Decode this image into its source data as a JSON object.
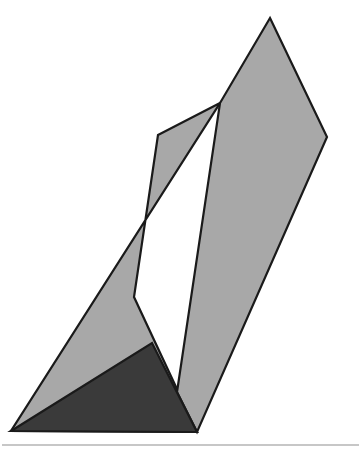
{
  "canvas": {
    "width": 361,
    "height": 470,
    "background_color": "#ffffff",
    "title": "Shaded geometric solid illustration"
  },
  "palette": {
    "light_gray_fill": "#a8a8a8",
    "dark_gray_fill": "#3a3a3a",
    "outline_stroke": "#1a1a1a",
    "rule_stroke": "#b4b4b4",
    "background": "#ffffff"
  },
  "figure": {
    "name": "two-faced-prism-with-shadow",
    "shapes": [
      {
        "id": "right-face",
        "label": "Right face",
        "fill_key": "light_gray_fill",
        "points": "270,18 327,137 197,432 177,392 220,103"
      },
      {
        "id": "left-face",
        "label": "Left face",
        "fill_key": "light_gray_fill",
        "points": "220,103 158,135 134,297 197,432 11,431"
      },
      {
        "id": "shadow-triangle",
        "label": "Shadow triangle",
        "fill_key": "dark_gray_fill",
        "points": "11,431 152,343 197,432"
      }
    ],
    "vertices": [
      {
        "id": "apex",
        "label": "Apex",
        "x": 270,
        "y": 18
      },
      {
        "id": "right-shoulder",
        "label": "Right shoulder",
        "x": 327,
        "y": 137
      },
      {
        "id": "ridge-top",
        "label": "Ridge top",
        "x": 220,
        "y": 103
      },
      {
        "id": "left-shoulder",
        "label": "Left shoulder",
        "x": 158,
        "y": 135
      },
      {
        "id": "inner-notch",
        "label": "Inner notch",
        "x": 134,
        "y": 297
      },
      {
        "id": "shadow-peak",
        "label": "Shadow peak",
        "x": 152,
        "y": 343
      },
      {
        "id": "bottom-left",
        "label": "Bottom left corner",
        "x": 11,
        "y": 431
      },
      {
        "id": "bottom-point",
        "label": "Bottom point",
        "x": 197,
        "y": 432
      }
    ],
    "baseline_rule": {
      "id": "baseline-rule",
      "label": "Horizontal rule",
      "x1": 2,
      "y1": 445,
      "x2": 359,
      "y2": 445
    }
  }
}
